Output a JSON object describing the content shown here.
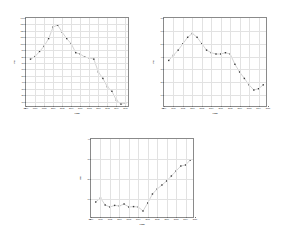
{
  "figure": {
    "background": "#ffffff",
    "marker_color": "#3a3a3a",
    "line_color": "#9a9a9a",
    "grid_color": "#e2e2e2",
    "axis_color": "#8a8a8a"
  },
  "panels": [
    {
      "id": "panel-a",
      "position": "top-left"
    },
    {
      "id": "panel-b",
      "position": "top-right"
    },
    {
      "id": "panel-c",
      "position": "bottom-center"
    }
  ],
  "chart_data": [
    {
      "type": "scatter",
      "id": "panel-a",
      "title": "",
      "xlabel": "Year",
      "ylabel": "PE",
      "xlim": [
        1994,
        2017
      ],
      "ylim": [
        0,
        1400
      ],
      "grid": true,
      "legend": "none",
      "xticks": [
        1994,
        1996,
        1998,
        2000,
        2002,
        2004,
        2006,
        2008,
        2010,
        2012,
        2014,
        2016
      ],
      "xtick_labels": [
        "1994",
        "1996",
        "1998",
        "2000",
        "2002",
        "2004",
        "2006",
        "2008",
        "2010",
        "2012",
        "2014",
        "2016"
      ],
      "yticks": [
        0,
        100,
        200,
        300,
        400,
        500,
        600,
        700,
        800,
        900,
        1000,
        1100,
        1200,
        1300,
        1400
      ],
      "ytick_labels": [
        "0",
        "100",
        "200",
        "300",
        "400",
        "500",
        "600",
        "700",
        "800",
        "900",
        "1000",
        "1100",
        "1200",
        "1300",
        "1400"
      ],
      "x": [
        1995,
        1996,
        1997,
        1998,
        1999,
        2000,
        2001,
        2002,
        2003,
        2004,
        2005,
        2006,
        2007,
        2008,
        2009,
        2010,
        2011,
        2012,
        2013,
        2014,
        2015,
        2016
      ],
      "y": [
        760,
        800,
        880,
        960,
        1080,
        1260,
        1290,
        1180,
        1080,
        1000,
        860,
        840,
        790,
        780,
        760,
        560,
        460,
        330,
        260,
        120,
        60,
        80
      ],
      "connected": true
    },
    {
      "type": "scatter",
      "id": "panel-b",
      "title": "",
      "xlabel": "Year",
      "ylabel": "PE",
      "xlim": [
        1994,
        2016
      ],
      "ylim": [
        0,
        70
      ],
      "grid": true,
      "legend": "none",
      "xticks": [
        1994,
        1996,
        1998,
        2000,
        2002,
        2004,
        2006,
        2008,
        2010,
        2012,
        2014,
        2016
      ],
      "xtick_labels": [
        "1994",
        "1996",
        "1998",
        "2000",
        "2002",
        "2004",
        "2006",
        "2008",
        "2010",
        "2012",
        "2014",
        "2016"
      ],
      "yticks": [
        0,
        10,
        20,
        30,
        40,
        50,
        60,
        70
      ],
      "ytick_labels": [
        "0",
        "10",
        "20",
        "30",
        "40",
        "50",
        "60",
        "70"
      ],
      "x": [
        1995,
        1996,
        1997,
        1998,
        1999,
        2000,
        2001,
        2002,
        2003,
        2004,
        2005,
        2006,
        2007,
        2008,
        2009,
        2010,
        2011,
        2012,
        2013,
        2014,
        2015
      ],
      "y": [
        37,
        41,
        45,
        50,
        55,
        58,
        55,
        50,
        45,
        43,
        42,
        42,
        43,
        42,
        34,
        28,
        23,
        18,
        14,
        15,
        18
      ],
      "connected": true
    },
    {
      "type": "scatter",
      "id": "panel-c",
      "title": "",
      "xlabel": "Year",
      "ylabel": "DE",
      "xlim": [
        1994,
        2016
      ],
      "ylim": [
        0,
        40
      ],
      "grid": true,
      "legend": "none",
      "xticks": [
        1994,
        1996,
        1998,
        2000,
        2002,
        2004,
        2006,
        2008,
        2010,
        2012,
        2014,
        2016
      ],
      "xtick_labels": [
        "1994",
        "1996",
        "1998",
        "2000",
        "2002",
        "2004",
        "2006",
        "2008",
        "2010",
        "2012",
        "2014",
        "2016"
      ],
      "yticks": [
        0,
        10,
        20,
        30,
        40
      ],
      "ytick_labels": [
        "0",
        "10",
        "20",
        "30",
        "40"
      ],
      "x": [
        1995,
        1996,
        1997,
        1998,
        1999,
        2000,
        2001,
        2002,
        2003,
        2004,
        2005,
        2006,
        2007,
        2008,
        2009,
        2010,
        2011,
        2012,
        2013,
        2014,
        2015
      ],
      "y": [
        8.5,
        10.5,
        7.0,
        6.0,
        6.8,
        6.5,
        7.5,
        6.0,
        6.2,
        6.0,
        4.0,
        8.0,
        12.5,
        15.0,
        17.0,
        19.0,
        21.5,
        24.0,
        26.5,
        27.0,
        29.5
      ],
      "connected": true
    }
  ]
}
